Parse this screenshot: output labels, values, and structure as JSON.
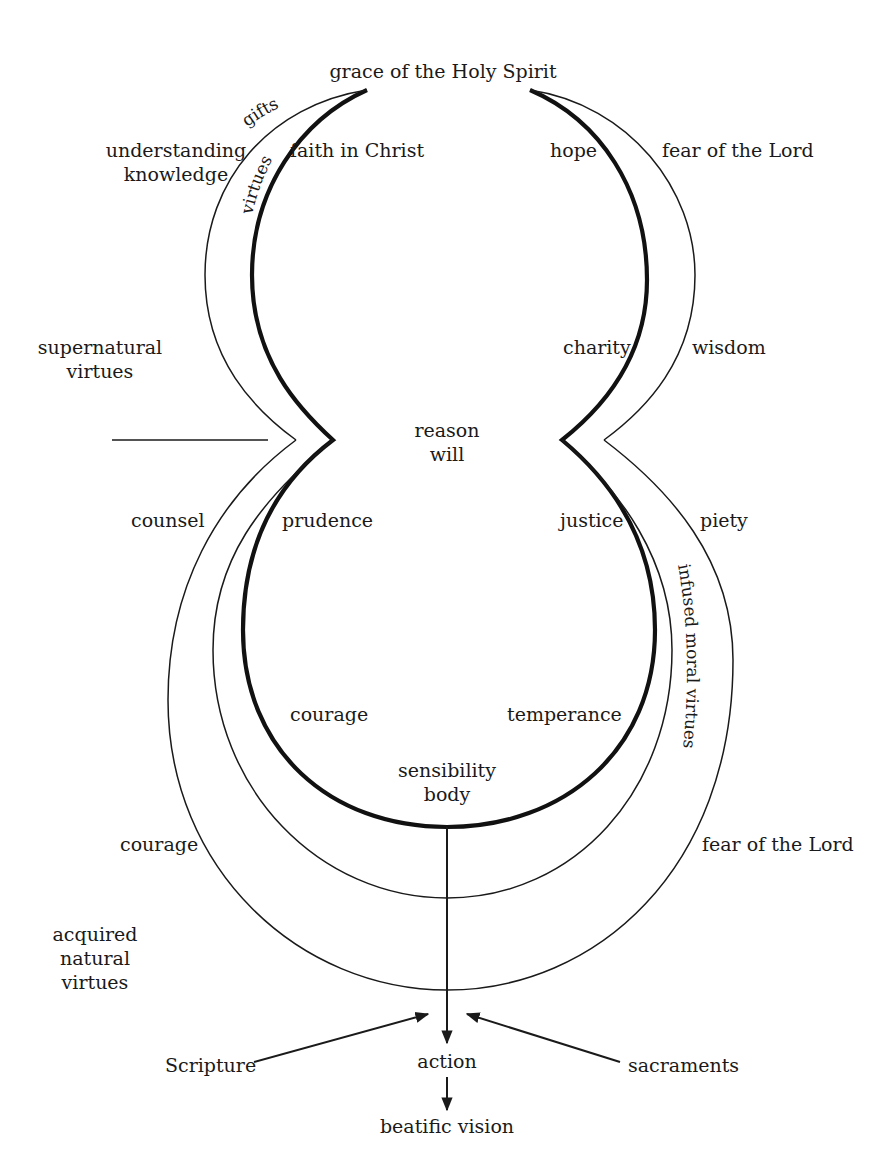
{
  "diagram": {
    "top_label": "grace of the Holy Spirit",
    "arc_labels": {
      "gifts": "gifts",
      "virtues": "virtues",
      "infused_moral_virtues": "infused moral virtues"
    },
    "upper_lobe": {
      "left_gift": [
        "understanding",
        "knowledge"
      ],
      "left_virtue": "faith in Christ",
      "right_virtue": "hope",
      "right_gift": "fear of the Lord",
      "right_virtue_lower": "charity",
      "right_gift_lower": "wisdom",
      "side_label": [
        "supernatural",
        "virtues"
      ]
    },
    "center": [
      "reason",
      "will"
    ],
    "lower_lobe": {
      "left_gift": "counsel",
      "left_virtue": "prudence",
      "right_virtue": "justice",
      "right_gift": "piety",
      "left_virtue_lower": "courage",
      "right_virtue_lower": "temperance",
      "bottom_center": [
        "sensibility",
        "body"
      ],
      "left_outer": "courage",
      "right_outer": "fear of the Lord",
      "side_label": [
        "acquired",
        "natural",
        "virtues"
      ]
    },
    "flow": {
      "left_input": "Scripture",
      "right_input": "sacraments",
      "action": "action",
      "result": "beatific vision"
    }
  }
}
